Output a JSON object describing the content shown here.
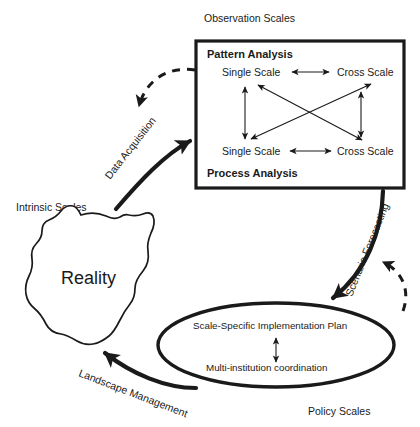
{
  "diagram": {
    "title_labels": {
      "observation_scales": "Observation Scales",
      "intrinsic_scales": "Intrinsic Scales",
      "policy_scales": "Policy Scales"
    },
    "analysis_box": {
      "header": "Pattern Analysis",
      "footer": "Process Analysis",
      "nodes": {
        "top_left": "Single Scale",
        "top_right": "Cross Scale",
        "bottom_left": "Single Scale",
        "bottom_right": "Cross Scale"
      }
    },
    "reality": {
      "label": "Reality"
    },
    "policy_ellipse": {
      "top_label": "Scale-Specific Implementation Plan",
      "bottom_label": "Multi-institution coordination"
    },
    "flow_labels": {
      "data_acquisition": "Data Acquisition",
      "scenario_forecasting": "Scenario Forecasting",
      "landscape_management": "Landscape Management"
    },
    "colors": {
      "ink": "#1a1a1a",
      "background": "#ffffff"
    }
  }
}
